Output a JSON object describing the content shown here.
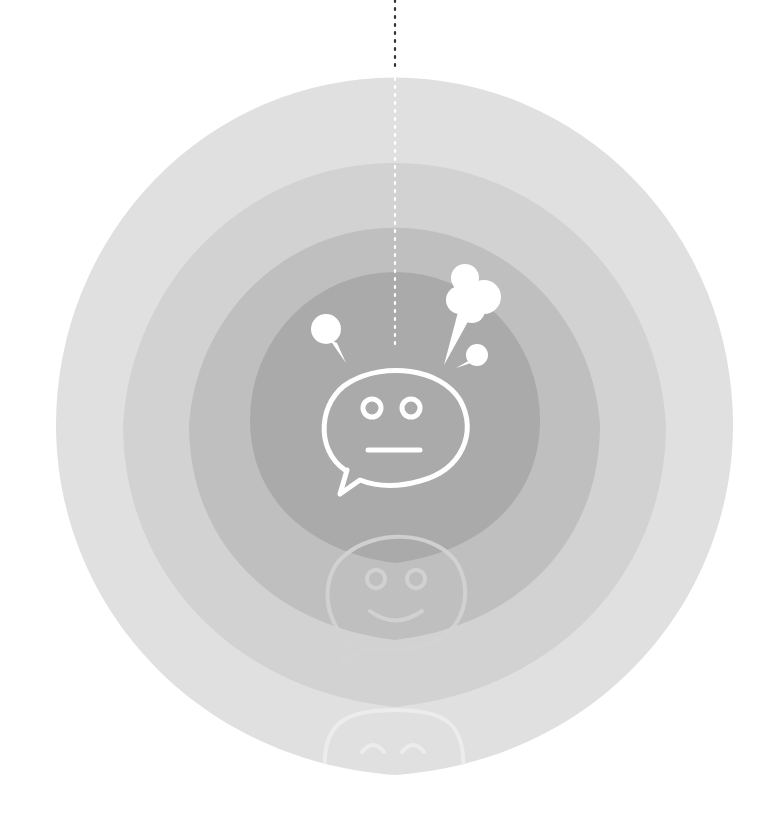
{
  "illustration": {
    "center": {
      "x": 394,
      "y": 425
    },
    "rings": [
      {
        "name": "outer",
        "color": "#e0e0e0",
        "rx": 339,
        "top": 78,
        "bottom": 775
      },
      {
        "name": "second",
        "color": "#d0d0d0",
        "rx": 272,
        "top": 146,
        "bottom": 707
      },
      {
        "name": "third",
        "color": "#bdbdbd",
        "rx": 206,
        "top": 213,
        "bottom": 640
      },
      {
        "name": "inner",
        "color": "#a9a9a9",
        "rx": 146,
        "top": 272,
        "bottom": 563
      }
    ],
    "dotted_line": {
      "x": 395,
      "from_y": 0,
      "to_y": 345
    },
    "icons": [
      {
        "name": "neutral-face-speech-bubble",
        "color": "#ffffff"
      },
      {
        "name": "smiling-face-speech-bubble",
        "color": "#d8d8d8"
      },
      {
        "name": "happy-face-speech-bubble",
        "color": "#ececec"
      }
    ]
  }
}
